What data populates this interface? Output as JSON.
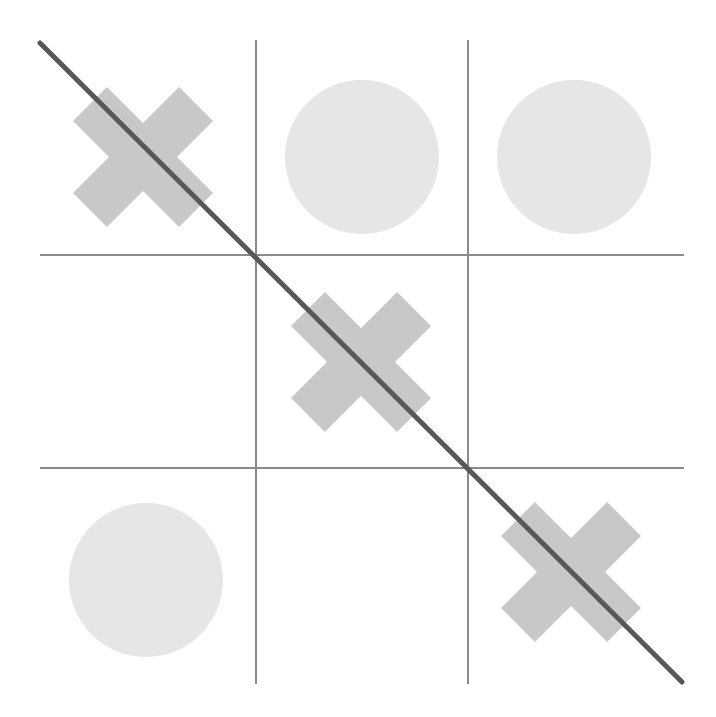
{
  "game": {
    "type": "tic-tac-toe",
    "board": [
      [
        "X",
        "O",
        "O"
      ],
      [
        "",
        "X",
        ""
      ],
      [
        "O",
        "",
        "X"
      ]
    ],
    "winner": "X",
    "winning_line": "diagonal-top-left-to-bottom-right",
    "colors": {
      "x_mark": "#c8c8c8",
      "o_mark": "#e6e6e6",
      "grid": "#8a8a8a",
      "win_line": "#585858",
      "background": "#ffffff"
    }
  }
}
